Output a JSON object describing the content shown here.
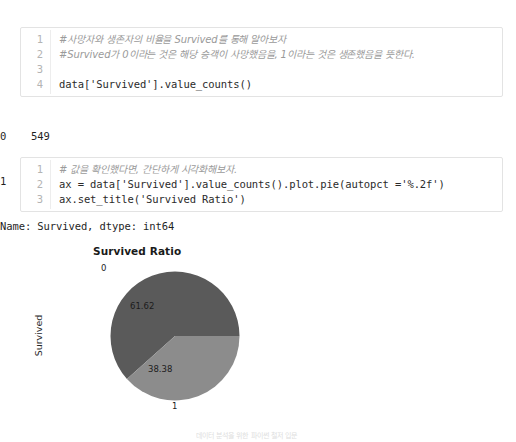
{
  "cells": [
    {
      "name": "code-cell-1",
      "lines": [
        {
          "no": "1",
          "text": "#사망자와 생존자의 비율을 Survived를 통해 알아보자",
          "comment": true
        },
        {
          "no": "2",
          "text": "#Survived가 0이라는 것은 해당 승객이 사망했음을, 1이라는 것은 생존했음을 뜻한다.",
          "comment": true
        },
        {
          "no": "3",
          "text": "",
          "comment": false
        },
        {
          "no": "4",
          "text": "data['Survived'].value_counts()",
          "comment": false
        }
      ]
    },
    {
      "name": "code-cell-2",
      "lines": [
        {
          "no": "1",
          "text": "# 값을 확인했다면, 간단하게 시각화해보자.",
          "comment": true
        },
        {
          "no": "2",
          "text": "ax = data['Survived'].value_counts().plot.pie(autopct ='%.2f')",
          "comment": false
        },
        {
          "no": "3",
          "text": "ax.set_title('Survived Ratio')",
          "comment": false
        }
      ]
    }
  ],
  "outputs": {
    "value_counts": [
      "0    549",
      "1    342",
      "Name: Survived, dtype: int64"
    ],
    "text_repr": "Text(0.5, 1.0, 'Survived Ratio')"
  },
  "chart_data": {
    "type": "pie",
    "title": "Survived Ratio",
    "ylabel": "Survived",
    "xlabel": "",
    "categories": [
      "0",
      "1"
    ],
    "values": [
      549,
      342
    ],
    "percent_labels": [
      "61.62",
      "38.38"
    ],
    "colors": [
      "#5a5a5a",
      "#8c8c8c"
    ],
    "start_angle": 0,
    "counterclock": true,
    "autopct": "%.2f",
    "legend": false,
    "grid": false
  },
  "caption": "데이터 분석을 위한 파이썬 철저 입문"
}
